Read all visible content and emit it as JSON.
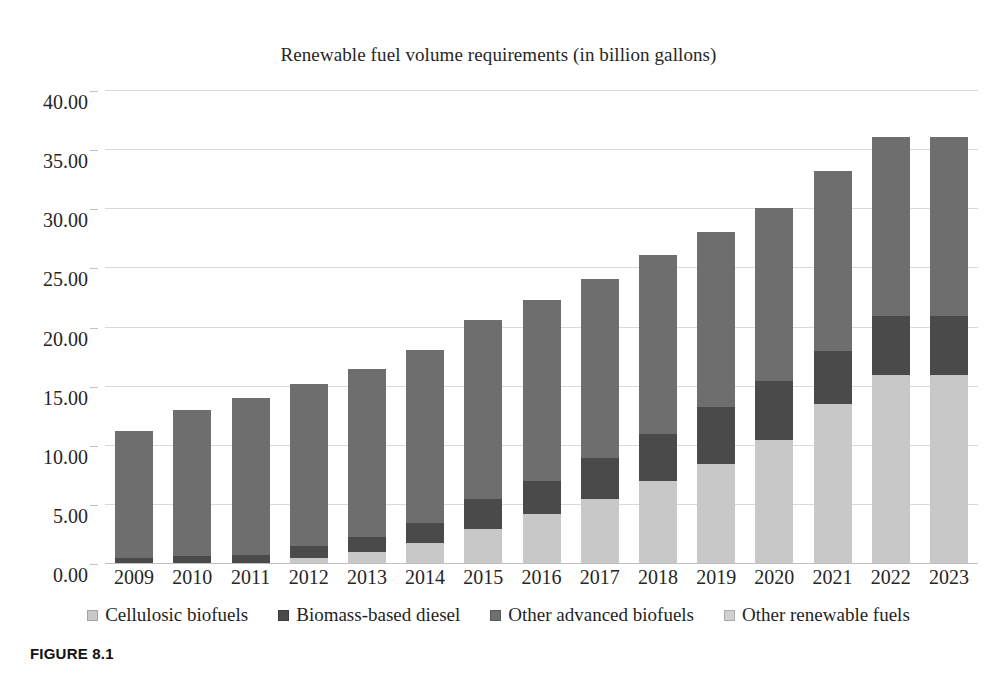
{
  "caption": "FIGURE 8.1",
  "chart_data": {
    "type": "bar",
    "stacked": true,
    "title": "Renewable fuel volume requirements (in billion gallons)",
    "xlabel": "",
    "ylabel": "",
    "ylim": [
      0,
      40
    ],
    "ytick_step": 5,
    "ytick_labels": [
      "0.00",
      "5.00",
      "10.00",
      "15.00",
      "20.00",
      "25.00",
      "30.00",
      "35.00",
      "40.00"
    ],
    "ytick_values": [
      0,
      5,
      10,
      15,
      20,
      25,
      30,
      35,
      40
    ],
    "grid": true,
    "legend_position": "bottom",
    "categories": [
      "2009",
      "2010",
      "2011",
      "2012",
      "2013",
      "2014",
      "2015",
      "2016",
      "2017",
      "2018",
      "2019",
      "2020",
      "2021",
      "2022",
      "2023"
    ],
    "series": [
      {
        "name": "Cellulosic biofuels",
        "color": "#c8c8c8",
        "values": [
          0.0,
          0.0,
          0.0,
          0.5,
          1.0,
          1.75,
          3.0,
          4.25,
          5.5,
          7.0,
          8.5,
          10.5,
          13.5,
          16.0,
          16.0
        ]
      },
      {
        "name": "Biomass-based diesel",
        "color": "#4a4a4a",
        "values": [
          0.5,
          0.65,
          0.8,
          1.0,
          1.28,
          1.75,
          2.5,
          2.75,
          3.5,
          4.0,
          4.75,
          5.0,
          4.5,
          5.0,
          5.0
        ]
      },
      {
        "name": "Other advanced biofuels",
        "color": "#6e6e6e",
        "values": [
          10.75,
          12.35,
          13.2,
          13.7,
          14.22,
          14.6,
          15.1,
          15.3,
          15.1,
          15.1,
          14.85,
          14.6,
          15.2,
          15.1,
          15.1
        ]
      },
      {
        "name": "Other renewable fuels",
        "color": "#d0d0d0",
        "values": [
          0,
          0,
          0,
          0,
          0,
          0,
          0,
          0,
          0,
          0,
          0,
          0,
          0,
          0,
          0
        ]
      }
    ],
    "totals": [
      11.25,
      13.0,
      14.0,
      15.2,
      16.5,
      18.1,
      20.6,
      22.3,
      24.1,
      26.1,
      28.1,
      30.1,
      33.2,
      36.1,
      36.1
    ]
  }
}
